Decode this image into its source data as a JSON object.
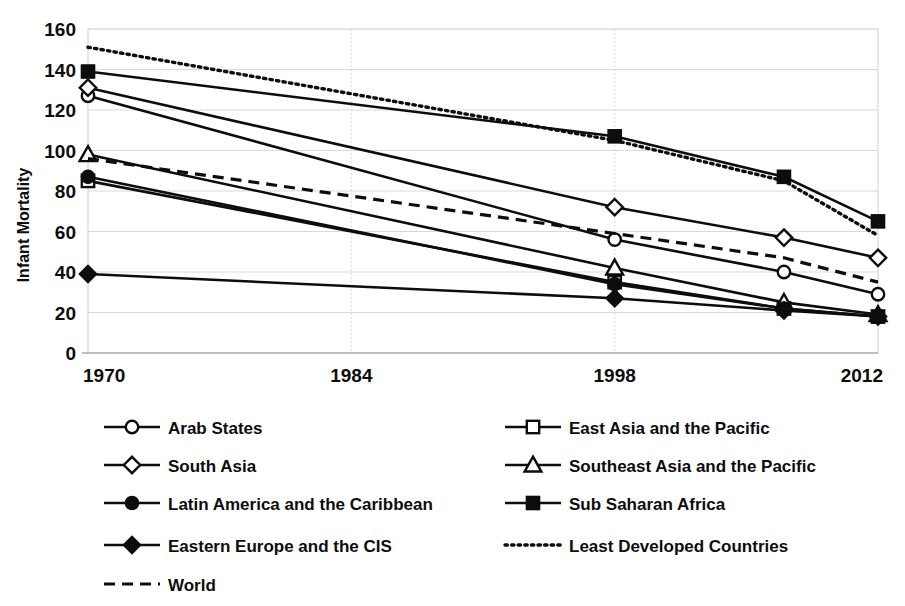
{
  "chart_data": {
    "type": "line",
    "title": "",
    "xlabel": "",
    "ylabel": "Infant Mortality",
    "x": [
      1970,
      1998,
      2007,
      2012
    ],
    "xtick_labels": [
      "1970",
      "1984",
      "1998",
      "2012"
    ],
    "xticks": [
      1970,
      1984,
      1998,
      2012
    ],
    "xlim": [
      1970,
      2012
    ],
    "ylim": [
      0,
      160
    ],
    "yticks": [
      0,
      20,
      40,
      60,
      80,
      100,
      120,
      140,
      160
    ],
    "ytick_labels": [
      "0",
      "20",
      "40",
      "60",
      "80",
      "100",
      "120",
      "140",
      "160"
    ],
    "grid": true,
    "legend_position": "bottom",
    "series": [
      {
        "name": "Arab States",
        "marker": "circle-open",
        "line": "solid",
        "values": [
          127,
          56,
          40,
          29
        ]
      },
      {
        "name": "East Asia and the Pacific",
        "marker": "square-open",
        "line": "solid",
        "values": [
          85,
          35,
          22,
          18
        ]
      },
      {
        "name": "South Asia",
        "marker": "diamond-open",
        "line": "solid",
        "values": [
          131,
          72,
          57,
          47
        ]
      },
      {
        "name": "Southeast Asia and the Pacific",
        "marker": "triangle-open",
        "line": "solid",
        "values": [
          98,
          42,
          25,
          19
        ]
      },
      {
        "name": "Latin America and the Caribbean",
        "marker": "circle-filled",
        "line": "solid",
        "values": [
          87,
          34,
          22,
          18
        ]
      },
      {
        "name": "Sub Saharan Africa",
        "marker": "square-filled",
        "line": "solid",
        "values": [
          139,
          107,
          87,
          65
        ]
      },
      {
        "name": "Eastern Europe and the CIS",
        "marker": "diamond-filled",
        "line": "solid",
        "values": [
          39,
          27,
          21,
          18
        ]
      },
      {
        "name": "Least Developed Countries",
        "marker": "none",
        "line": "dotted",
        "values": [
          151,
          105,
          85,
          58
        ]
      },
      {
        "name": "World",
        "marker": "none",
        "line": "dashed",
        "values": [
          96,
          59,
          47,
          35
        ]
      }
    ]
  },
  "axis": {
    "y_title": "Infant Mortality",
    "y_ticks": [
      "160",
      "140",
      "120",
      "100",
      "80",
      "60",
      "40",
      "20",
      "0"
    ],
    "x_ticks": [
      "1970",
      "1984",
      "1998",
      "2012"
    ]
  },
  "legend": {
    "entries": [
      {
        "label": "Arab States",
        "marker": "circle-open",
        "line": "solid"
      },
      {
        "label": "East Asia and the Pacific",
        "marker": "square-open",
        "line": "solid"
      },
      {
        "label": "South Asia",
        "marker": "diamond-open",
        "line": "solid"
      },
      {
        "label": "Southeast Asia and the Pacific",
        "marker": "triangle-open",
        "line": "solid"
      },
      {
        "label": "Latin America and the Caribbean",
        "marker": "circle-filled",
        "line": "solid"
      },
      {
        "label": "Sub Saharan Africa",
        "marker": "square-filled",
        "line": "solid"
      },
      {
        "label": "Eastern Europe and the CIS",
        "marker": "diamond-filled",
        "line": "solid"
      },
      {
        "label": "Least Developed Countries",
        "marker": "none",
        "line": "dotted"
      },
      {
        "label": "World",
        "marker": "none",
        "line": "dashed"
      }
    ]
  },
  "colors": {
    "ink": "#0d0d0d",
    "grid": "#d9d9d9",
    "background": "#ffffff"
  }
}
